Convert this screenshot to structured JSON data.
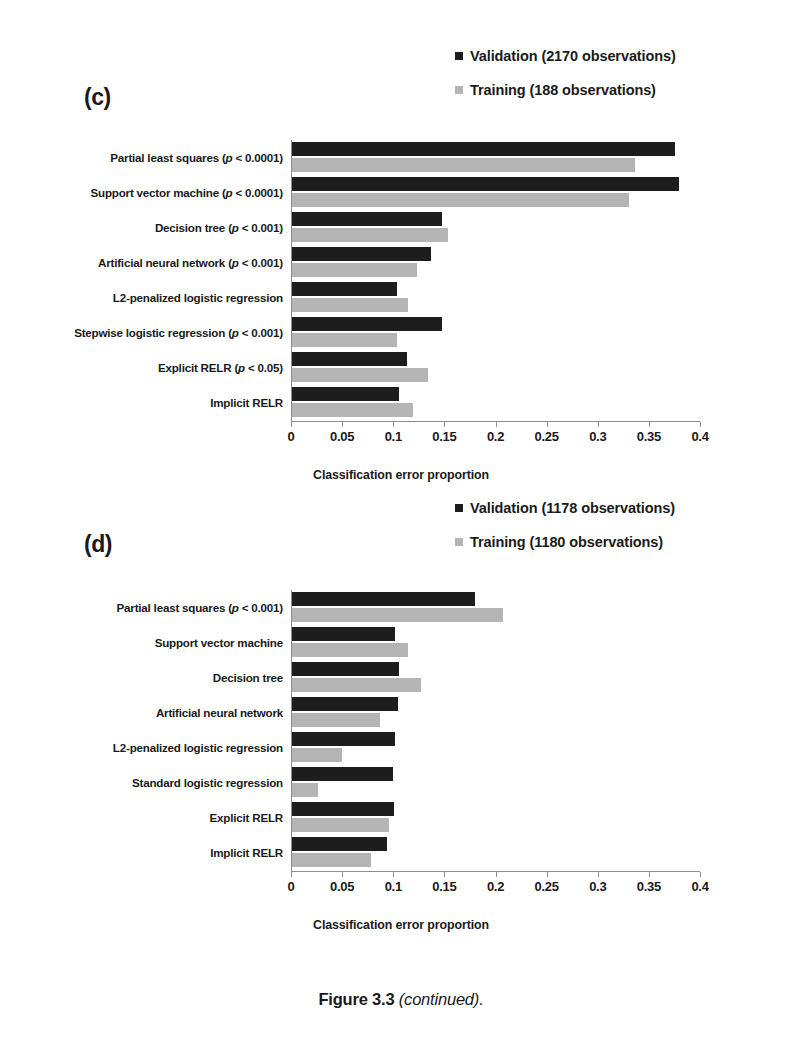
{
  "figure": {
    "caption_main": "Figure 3.3",
    "caption_note": "(continued)."
  },
  "colors": {
    "validation": "#1d1d1d",
    "training": "#b4b4b4",
    "axis": "#8d8d8d",
    "text": "#1a1a1a"
  },
  "panels": [
    {
      "letter": "(c)",
      "legend": [
        {
          "series": "validation",
          "label": "Validation (2170 observations)"
        },
        {
          "series": "training",
          "label": "Training (188 observations)"
        }
      ],
      "axis_title": "Classification error proportion",
      "tick_labels": [
        "0",
        "0.05",
        "0.1",
        "0.15",
        "0.2",
        "0.25",
        "0.3",
        "0.35",
        "0.4"
      ],
      "categories": [
        "Partial least squares (p < 0.0001)",
        "Support vector machine (p < 0.0001)",
        "Decision tree (p < 0.001)",
        "Artificial neural network (p < 0.001)",
        "L2-penalized logistic regression",
        "Stepwise logistic regression (p < 0.001)",
        "Explicit RELR (p < 0.05)",
        "Implicit RELR"
      ]
    },
    {
      "letter": "(d)",
      "legend": [
        {
          "series": "validation",
          "label": "Validation (1178 observations)"
        },
        {
          "series": "training",
          "label": "Training (1180 observations)"
        }
      ],
      "axis_title": "Classification error proportion",
      "tick_labels": [
        "0",
        "0.05",
        "0.1",
        "0.15",
        "0.2",
        "0.25",
        "0.3",
        "0.35",
        "0.4"
      ],
      "categories": [
        "Partial least squares (p < 0.001)",
        "Support vector machine",
        "Decision tree",
        "Artificial neural network",
        "L2-penalized logistic regression",
        "Standard  logistic regression",
        "Explicit RELR",
        "Implicit RELR"
      ]
    }
  ],
  "chart_data": [
    {
      "type": "bar",
      "orientation": "horizontal",
      "panel": "(c)",
      "title": "",
      "xlabel": "Classification error proportion",
      "ylabel": "",
      "xlim": [
        0,
        0.4
      ],
      "xticks": [
        0,
        0.05,
        0.1,
        0.15,
        0.2,
        0.25,
        0.3,
        0.35,
        0.4
      ],
      "grid": false,
      "legend_position": "top-right",
      "categories": [
        "Partial least squares (p < 0.0001)",
        "Support vector machine (p < 0.0001)",
        "Decision tree (p < 0.001)",
        "Artificial neural network (p < 0.001)",
        "L2-penalized logistic regression",
        "Stepwise logistic regression (p < 0.001)",
        "Explicit RELR (p < 0.05)",
        "Implicit RELR"
      ],
      "series": [
        {
          "name": "Validation (2170 observations)",
          "values": [
            0.375,
            0.378,
            0.147,
            0.136,
            0.103,
            0.147,
            0.112,
            0.105
          ]
        },
        {
          "name": "Training (188 observations)",
          "values": [
            0.335,
            0.33,
            0.153,
            0.122,
            0.113,
            0.103,
            0.133,
            0.118
          ]
        }
      ]
    },
    {
      "type": "bar",
      "orientation": "horizontal",
      "panel": "(d)",
      "title": "",
      "xlabel": "Classification error proportion",
      "ylabel": "",
      "xlim": [
        0,
        0.4
      ],
      "xticks": [
        0,
        0.05,
        0.1,
        0.15,
        0.2,
        0.25,
        0.3,
        0.35,
        0.4
      ],
      "grid": false,
      "legend_position": "top-right",
      "categories": [
        "Partial least squares (p < 0.001)",
        "Support vector machine",
        "Decision tree",
        "Artificial neural network",
        "L2-penalized logistic regression",
        "Standard  logistic regression",
        "Explicit RELR",
        "Implicit RELR"
      ],
      "series": [
        {
          "name": "Validation (1178 observations)",
          "values": [
            0.179,
            0.101,
            0.105,
            0.104,
            0.101,
            0.099,
            0.1,
            0.093
          ]
        },
        {
          "name": "Training (1180 observations)",
          "values": [
            0.206,
            0.113,
            0.126,
            0.086,
            0.049,
            0.025,
            0.095,
            0.077
          ]
        }
      ]
    }
  ]
}
